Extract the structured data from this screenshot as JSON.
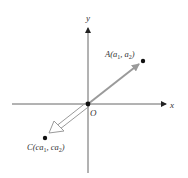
{
  "diagram": {
    "axes": {
      "x_label": "x",
      "y_label": "y",
      "origin_label": "O"
    },
    "points": [
      {
        "id": "A",
        "name": "A",
        "coords_text": "(a1, a2)",
        "x_sub": "1",
        "y_sub": "2",
        "a_text": "a",
        "label_prefix": "A(",
        "sep": ", ",
        "suffix": ")"
      },
      {
        "id": "C",
        "name": "C",
        "coords_text": "(ca1, ca2)",
        "x_sub": "1",
        "y_sub": "2",
        "a_text": "ca",
        "label_prefix": "C(",
        "sep": ", ",
        "suffix": ")"
      }
    ],
    "vectors": [
      {
        "from": "O",
        "to": "A",
        "style": "filled-gray",
        "color": "#9a9a9a"
      },
      {
        "from": "O",
        "to": "C",
        "style": "hollow",
        "color": "#9a9a9a"
      }
    ],
    "colors": {
      "axis": "#555555",
      "point": "#111111",
      "vector": "#9a9a9a"
    }
  }
}
